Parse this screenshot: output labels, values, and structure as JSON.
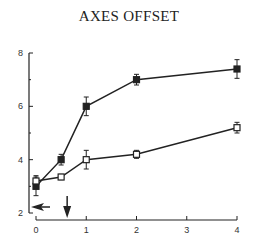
{
  "title": "AXES OFFSET",
  "chart_data": {
    "type": "line",
    "title": "AXES OFFSET",
    "xlabel": "",
    "ylabel": "",
    "xlim": [
      0,
      4
    ],
    "ylim": [
      2,
      8
    ],
    "x_ticks": [
      "0",
      "1",
      "2",
      "3",
      "4"
    ],
    "y_ticks": [
      "2",
      "4",
      "6",
      "8"
    ],
    "grid": false,
    "legend": null,
    "series": [
      {
        "name": "filled squares",
        "marker": "filled-square",
        "x": [
          0,
          0.5,
          1,
          2,
          4
        ],
        "values": [
          3.0,
          4.0,
          6.0,
          7.0,
          7.4
        ],
        "error": [
          0.35,
          0.2,
          0.35,
          0.2,
          0.35
        ]
      },
      {
        "name": "open squares",
        "marker": "open-square",
        "x": [
          0,
          0.5,
          1,
          2,
          4
        ],
        "values": [
          3.2,
          3.35,
          4.0,
          4.2,
          5.2
        ],
        "error": [
          0.2,
          0.1,
          0.35,
          0.15,
          0.2
        ]
      }
    ],
    "annotations": [
      {
        "type": "arrow-left",
        "description": "horizontal arrow pointing left near y-axis at y≈2.3"
      },
      {
        "type": "arrow-down",
        "description": "vertical arrow pointing down at x≈0.6"
      }
    ]
  }
}
